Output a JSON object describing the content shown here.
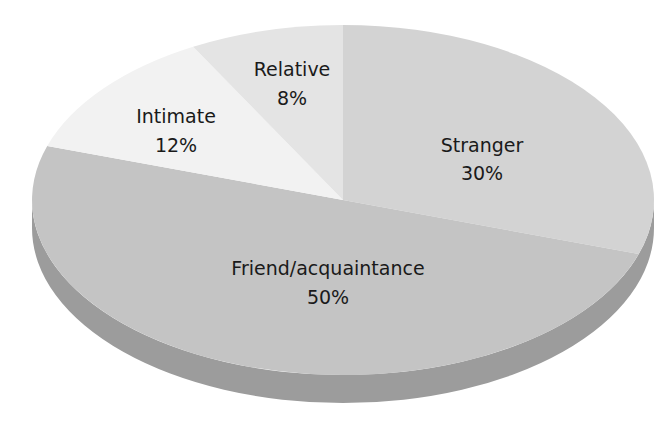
{
  "chart_data": {
    "type": "pie",
    "style": "3d-tilted",
    "title": "",
    "start_angle_deg": -90,
    "direction": "clockwise",
    "slices": [
      {
        "label": "Stranger",
        "value": 30,
        "value_label": "30%",
        "color": "#d3d3d3"
      },
      {
        "label": "Friend/acquaintance",
        "value": 50,
        "value_label": "50%",
        "color": "#c4c4c4"
      },
      {
        "label": "Intimate",
        "value": 12,
        "value_label": "12%",
        "color": "#f2f2f2"
      },
      {
        "label": "Relative",
        "value": 8,
        "value_label": "8%",
        "color": "#e4e4e4"
      }
    ],
    "side_color": "#9c9c9c",
    "legend": "none (labels inside slices)"
  },
  "labels": {
    "stranger": {
      "name": "Stranger",
      "pct": "30%"
    },
    "friend": {
      "name": "Friend/acquaintance",
      "pct": "50%"
    },
    "intimate": {
      "name": "Intimate",
      "pct": "12%"
    },
    "relative": {
      "name": "Relative",
      "pct": "8%"
    }
  }
}
